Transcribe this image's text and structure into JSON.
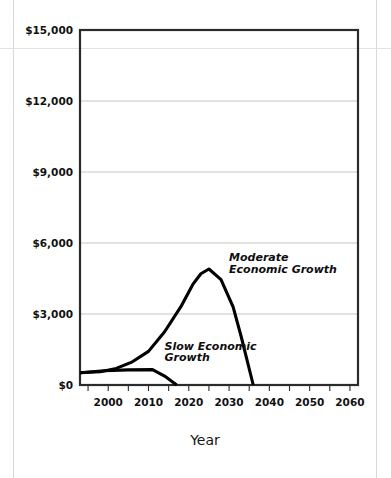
{
  "chart_data": {
    "type": "line",
    "title": "",
    "xlabel": "Year",
    "ylabel": "",
    "xlim": [
      1993,
      2062
    ],
    "ylim": [
      0,
      15000
    ],
    "grid": true,
    "legend_position": "inline-annotations",
    "x_tick_labels": [
      "2000",
      "2010",
      "2020",
      "2030",
      "2040",
      "2050",
      "2060"
    ],
    "x_tick_values": [
      2000,
      2010,
      2020,
      2030,
      2040,
      2050,
      2060
    ],
    "x_minor_tick_values": [
      1995,
      2000,
      2005,
      2010,
      2015,
      2020,
      2025,
      2030,
      2035,
      2040,
      2045,
      2050,
      2055,
      2060
    ],
    "y_tick_labels": [
      "$0",
      "$3,000",
      "$6,000",
      "$9,000",
      "$12,000",
      "$15,000"
    ],
    "y_tick_values": [
      0,
      3000,
      6000,
      9000,
      12000,
      15000
    ],
    "series": [
      {
        "name": "Moderate Economic Growth",
        "label_line_1": "Moderate",
        "label_line_2": "Economic Growth",
        "color": "#000000",
        "x": [
          1993,
          1998,
          2002,
          2006,
          2010,
          2014,
          2018,
          2021,
          2023,
          2025,
          2028,
          2031,
          2033,
          2036
        ],
        "y": [
          520,
          560,
          700,
          980,
          1420,
          2250,
          3300,
          4250,
          4700,
          4900,
          4450,
          3300,
          2050,
          0
        ]
      },
      {
        "name": "Slow Economic Growth",
        "label_line_1": "Slow Economic",
        "label_line_2": "Growth",
        "color": "#000000",
        "x": [
          1993,
          1999,
          2005,
          2011,
          2014,
          2017
        ],
        "y": [
          520,
          600,
          640,
          650,
          380,
          0
        ]
      }
    ],
    "annotations": [
      {
        "text": "Moderate",
        "x": 2030,
        "y": 5250
      },
      {
        "text": "Economic Growth",
        "x": 2030,
        "y": 4750
      },
      {
        "text": "Slow Economic",
        "x": 2014,
        "y": 1500
      },
      {
        "text": "Growth",
        "x": 2014,
        "y": 1000
      }
    ]
  }
}
